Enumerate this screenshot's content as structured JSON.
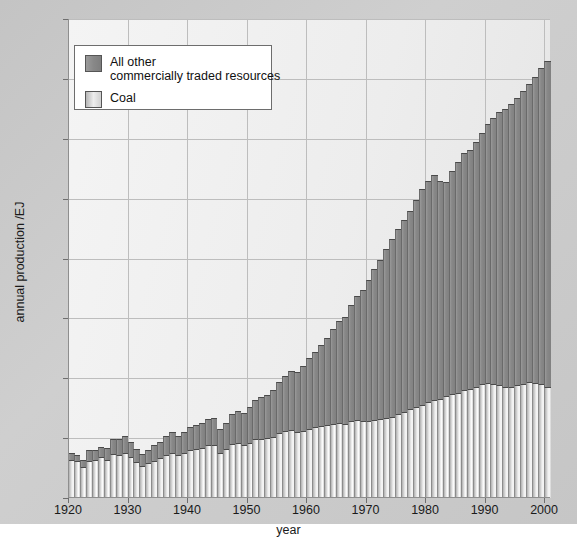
{
  "chart_data": {
    "type": "bar",
    "subtype": "stacked-bar",
    "title": "",
    "xlabel": "year",
    "ylabel": "annual production /EJ",
    "xlim": [
      1920,
      2001
    ],
    "ylim": [
      0,
      400
    ],
    "ytick_step": 50,
    "xtick_step": 10,
    "grid": true,
    "legend_position": "upper-left-inside",
    "yticks": [
      "0",
      "50",
      "100",
      "150",
      "200",
      "250",
      "300",
      "350",
      "400"
    ],
    "xticks": [
      "1920",
      "1930",
      "1940",
      "1950",
      "1960",
      "1970",
      "1980",
      "1990",
      "2000"
    ],
    "series": [
      {
        "name": "Coal",
        "color": "#e8e8e8",
        "values": [
          32,
          31,
          26,
          31,
          32,
          34,
          32,
          37,
          36,
          38,
          34,
          30,
          27,
          29,
          31,
          33,
          36,
          38,
          36,
          38,
          40,
          41,
          42,
          44,
          44,
          38,
          41,
          45,
          46,
          44,
          46,
          49,
          49,
          50,
          51,
          54,
          56,
          57,
          55,
          56,
          58,
          59,
          60,
          61,
          62,
          63,
          62,
          64,
          65,
          64,
          64,
          65,
          66,
          67,
          68,
          70,
          72,
          74,
          76,
          78,
          80,
          82,
          83,
          85,
          87,
          88,
          90,
          91,
          93,
          95,
          96,
          95,
          94,
          93,
          93,
          94,
          95,
          97,
          96,
          95,
          93
        ]
      },
      {
        "name": "All other commercially traded resources",
        "color": "#888888",
        "values": [
          6,
          5,
          6,
          9,
          8,
          9,
          10,
          12,
          13,
          14,
          13,
          11,
          10,
          11,
          13,
          14,
          16,
          17,
          16,
          17,
          19,
          20,
          21,
          22,
          23,
          20,
          22,
          25,
          27,
          27,
          30,
          33,
          35,
          36,
          39,
          43,
          46,
          49,
          50,
          54,
          59,
          63,
          68,
          73,
          79,
          85,
          89,
          97,
          104,
          110,
          118,
          126,
          133,
          141,
          148,
          155,
          160,
          166,
          173,
          180,
          185,
          188,
          182,
          179,
          186,
          193,
          198,
          200,
          204,
          210,
          216,
          222,
          228,
          232,
          236,
          240,
          245,
          249,
          256,
          264,
          272
        ]
      }
    ],
    "x": [
      1920,
      1921,
      1922,
      1923,
      1924,
      1925,
      1926,
      1927,
      1928,
      1929,
      1930,
      1931,
      1932,
      1933,
      1934,
      1935,
      1936,
      1937,
      1938,
      1939,
      1940,
      1941,
      1942,
      1943,
      1944,
      1945,
      1946,
      1947,
      1948,
      1949,
      1950,
      1951,
      1952,
      1953,
      1954,
      1955,
      1956,
      1957,
      1958,
      1959,
      1960,
      1961,
      1962,
      1963,
      1964,
      1965,
      1966,
      1967,
      1968,
      1969,
      1970,
      1971,
      1972,
      1973,
      1974,
      1975,
      1976,
      1977,
      1978,
      1979,
      1980,
      1981,
      1982,
      1983,
      1984,
      1985,
      1986,
      1987,
      1988,
      1989,
      1990,
      1991,
      1992,
      1993,
      1994,
      1995,
      1996,
      1997,
      1998,
      1999,
      2000
    ]
  },
  "legend": {
    "entries": [
      {
        "label_line1": "All other",
        "label_line2": "commercially traded resources",
        "swatch": "dark-gray-swatch"
      },
      {
        "label_line1": "Coal",
        "label_line2": "",
        "swatch": "light-gradient-swatch"
      }
    ]
  },
  "axes": {
    "x_title": "year",
    "y_title": "annual production /EJ"
  }
}
